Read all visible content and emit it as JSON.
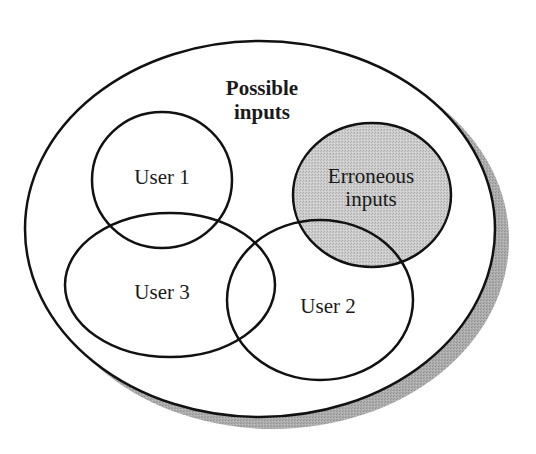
{
  "diagram": {
    "type": "venn",
    "colors": {
      "stroke": "#111111",
      "background": "#ffffff",
      "shadow": "#a8a8a8",
      "erroneous_fill": "#c6c6c6"
    },
    "universe": {
      "label_line1": "Possible",
      "label_line2": "inputs"
    },
    "sets": [
      {
        "id": "user1",
        "label": "User 1"
      },
      {
        "id": "user3",
        "label": "User 3"
      },
      {
        "id": "user2",
        "label": "User 2"
      },
      {
        "id": "erroneous",
        "label_line1": "Erroneous",
        "label_line2": "inputs",
        "highlighted": true
      }
    ]
  }
}
